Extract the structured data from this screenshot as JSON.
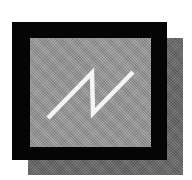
{
  "icon": {
    "name": "waveform-display-icon",
    "description": "Black-framed screen with sawtooth waveform and drop shadow",
    "colors": {
      "frame": "#050505",
      "panel": "#9c9c9c",
      "shadow": "#6c6c6c",
      "waveform": "#f4f4f4",
      "background": "#ffffff"
    },
    "waveform_points": "18,80 62,35 63,75 103,34"
  }
}
